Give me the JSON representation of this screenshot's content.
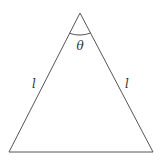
{
  "diagram": {
    "type": "isosceles-triangle",
    "colors": {
      "stroke": "#555555",
      "text": "#333333",
      "background": "#ffffff"
    },
    "vertices": {
      "apex": [
        80,
        13
      ],
      "base_left": [
        9,
        152
      ],
      "base_right": [
        153,
        152
      ]
    },
    "labels": {
      "apex_angle": "θ",
      "left_side": "l",
      "right_side": "l"
    }
  }
}
